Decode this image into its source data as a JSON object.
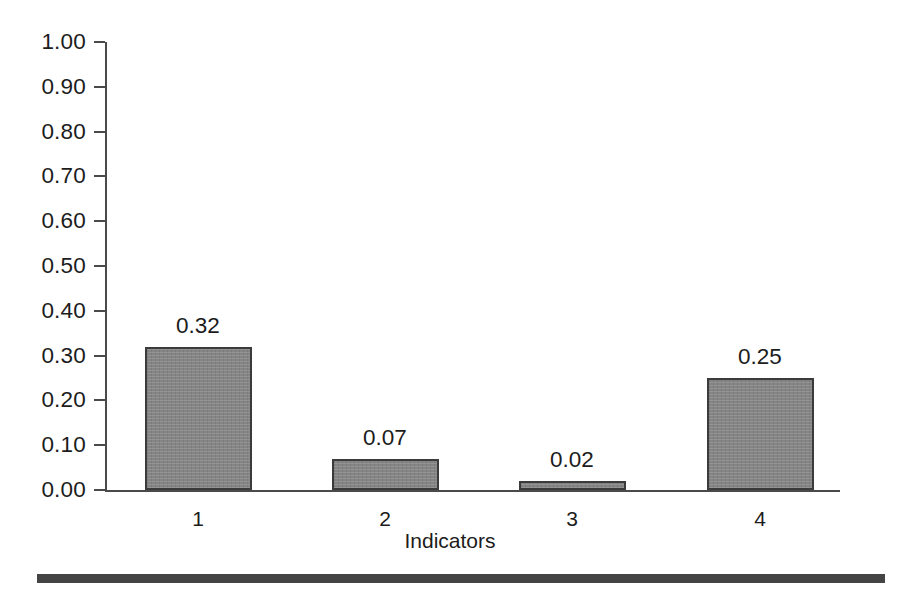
{
  "chart_data": {
    "type": "bar",
    "title": "",
    "subtitle": "",
    "xlabel": "Indicators",
    "ylabel": "",
    "categories": [
      "1",
      "2",
      "3",
      "4"
    ],
    "values": [
      0.32,
      0.07,
      0.02,
      0.25
    ],
    "value_labels": [
      "0.32",
      "0.07",
      "0.02",
      "0.25"
    ],
    "ylim": [
      0.0,
      1.0
    ],
    "ytick_values": [
      1.0,
      0.9,
      0.8,
      0.7,
      0.6,
      0.5,
      0.4,
      0.3,
      0.2,
      0.1,
      0.0
    ],
    "ytick_labels": [
      "1.00",
      "0.90",
      "0.80",
      "0.70",
      "0.60",
      "0.50",
      "0.40",
      "0.30",
      "0.20",
      "0.10",
      "0.00"
    ],
    "grid": false,
    "legend": false,
    "legend_position": "none",
    "series": [
      {
        "name": "",
        "values": [
          0.32,
          0.07,
          0.02,
          0.25
        ]
      }
    ],
    "colors": {
      "bar_fill": "#858585",
      "bar_border": "#3b3b3b",
      "axis": "#4a4a4a",
      "text": "#1c1c1c",
      "background": "#ffffff",
      "rule": "#444444"
    }
  },
  "footer": {
    "rule_present": true
  }
}
